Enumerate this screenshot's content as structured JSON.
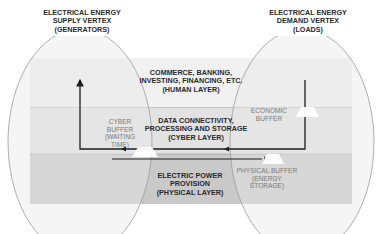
{
  "vertices": {
    "supply": {
      "lines": [
        "ELECTRICAL ENERGY",
        "SUPPLY VERTEX",
        "(GENERATORS)"
      ]
    },
    "demand": {
      "lines": [
        "ELECTRICAL ENERGY",
        "DEMAND VERTEX",
        "(LOADS)"
      ]
    }
  },
  "layers": {
    "human": {
      "lines": [
        "COMMERCE, BANKING,",
        "INVESTING, FINANCING, ETC.",
        "(HUMAN LAYER)"
      ],
      "color": "#f1f1f1"
    },
    "cyber": {
      "lines": [
        "DATA CONNECTIVITY,",
        "PROCESSING AND STORAGE",
        "(CYBER LAYER)"
      ],
      "color": "#e2e2e2"
    },
    "physical": {
      "lines": [
        "ELECTRIC POWER",
        "PROVISION",
        "(PHYSICAL LAYER)"
      ],
      "color": "#c9c9c9"
    }
  },
  "buffers": {
    "cyber": {
      "lines": [
        "CYBER",
        "BUFFER",
        "(WAITING",
        "TIME)"
      ]
    },
    "economic": {
      "lines": [
        "ECONOMIC",
        "BUFFER"
      ]
    },
    "physical": {
      "lines": [
        "PHYSICAL BUFFER",
        "(ENERGY",
        "STORAGE)"
      ]
    }
  },
  "colors": {
    "ellipse_fill": "#e6e6e6",
    "ellipse_stroke": "#9a9a9a",
    "arrow": "#1e1e1e",
    "buffer_fill": "#ffffff"
  }
}
